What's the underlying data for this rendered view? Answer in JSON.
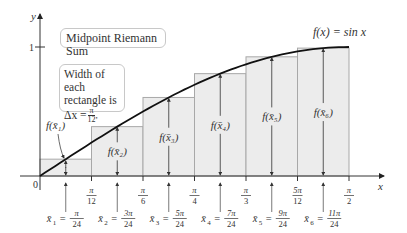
{
  "title": "Midpoint Riemann Sum",
  "function_label": "f(x) = sin x",
  "width_note": {
    "line1": "Width of each",
    "line2": "rectangle is",
    "delta": "Δx = ",
    "num": "π",
    "den": "12"
  },
  "axes": {
    "x_label": "x",
    "y_label": "y",
    "origin_label": "0",
    "y_tick": "1",
    "x_ticks": [
      {
        "num": "π",
        "den": "12"
      },
      {
        "num": "π",
        "den": "6"
      },
      {
        "num": "π",
        "den": "4"
      },
      {
        "num": "π",
        "den": "3"
      },
      {
        "num": "5π",
        "den": "12"
      },
      {
        "num": "π",
        "den": "2"
      }
    ]
  },
  "heights_labels": [
    "f(x̄₁)",
    "f(x̄₂)",
    "f(x̄₃)",
    "f(x̄₄)",
    "f(x̄₅)",
    "f(x̄₆)"
  ],
  "midpoints": [
    {
      "sym": "x̄",
      "sub": "1",
      "num": "π",
      "den": "24"
    },
    {
      "sym": "x̄",
      "sub": "2",
      "num": "3π",
      "den": "24"
    },
    {
      "sym": "x̄",
      "sub": "3",
      "num": "5π",
      "den": "24"
    },
    {
      "sym": "x̄",
      "sub": "4",
      "num": "7π",
      "den": "24"
    },
    {
      "sym": "x̄",
      "sub": "5",
      "num": "9π",
      "den": "24"
    },
    {
      "sym": "x̄",
      "sub": "6",
      "num": "11π",
      "den": "24"
    }
  ],
  "chart_data": {
    "type": "bar",
    "title": "Midpoint Riemann Sum",
    "function": "f(x) = sin x",
    "interval": [
      0,
      1.5708
    ],
    "n": 6,
    "delta_x": "π/12",
    "categories": [
      "π/24",
      "3π/24",
      "5π/24",
      "7π/24",
      "9π/24",
      "11π/24"
    ],
    "values": [
      0.1305,
      0.3827,
      0.6088,
      0.7934,
      0.9239,
      0.9914
    ],
    "xlabel": "x",
    "ylabel": "y",
    "ylim": [
      0,
      1
    ],
    "colors": {
      "rect_fill": "#ececec",
      "rect_stroke": "#a8a8a8",
      "curve": "#111111",
      "axis": "#333333"
    }
  }
}
